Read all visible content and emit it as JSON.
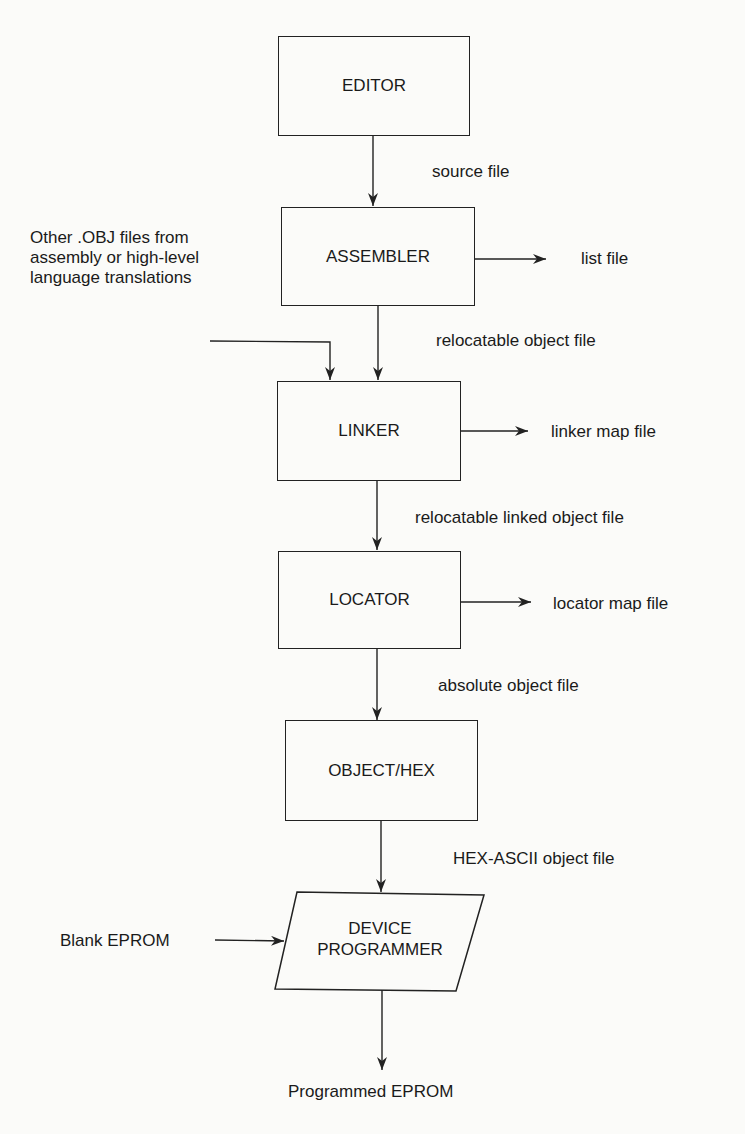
{
  "diagram": {
    "type": "flowchart",
    "nodes": [
      {
        "id": "editor",
        "label": "EDITOR"
      },
      {
        "id": "assembler",
        "label": "ASSEMBLER"
      },
      {
        "id": "linker",
        "label": "LINKER"
      },
      {
        "id": "locator",
        "label": "LOCATOR"
      },
      {
        "id": "objecthex",
        "label": "OBJECT/HEX"
      },
      {
        "id": "device",
        "label_line1": "DEVICE",
        "label_line2": "PROGRAMMER"
      }
    ],
    "edges": {
      "editor_to_assembler": "source file",
      "assembler_to_linker": "relocatable object file",
      "linker_to_locator": "relocatable linked object file",
      "locator_to_objecthex": "absolute object file",
      "objecthex_to_device": "HEX-ASCII object file"
    },
    "outputs": {
      "assembler": "list file",
      "linker": "linker map file",
      "locator": "locator map file",
      "device": "Programmed EPROM"
    },
    "inputs": {
      "linker_line1": "Other .OBJ files from",
      "linker_line2": "assembly or high-level",
      "linker_line3": "language translations",
      "device": "Blank EPROM"
    }
  }
}
